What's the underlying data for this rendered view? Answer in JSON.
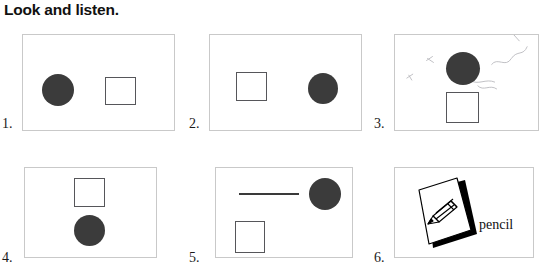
{
  "title": "Look and listen.",
  "colors": {
    "circle_fill": "#3b3b3b",
    "square_stroke": "#56565a",
    "panel_border": "#c9c9c9",
    "line_stroke": "#3a3a3a",
    "text": "#111111",
    "page_background": "#ffffff"
  },
  "exercises": [
    {
      "number": "1.",
      "shapes": [
        "circle",
        "square"
      ],
      "arrangement": "circle-left-square-right"
    },
    {
      "number": "2.",
      "shapes": [
        "square",
        "circle"
      ],
      "arrangement": "square-left-circle-right"
    },
    {
      "number": "3.",
      "shapes": [
        "circle",
        "square"
      ],
      "arrangement": "circle-top-square-below",
      "has_pencil_marks": true
    },
    {
      "number": "4.",
      "shapes": [
        "square",
        "circle"
      ],
      "arrangement": "square-top-circle-below"
    },
    {
      "number": "5.",
      "shapes": [
        "line",
        "circle",
        "square"
      ],
      "arrangement": "line-left-circle-topright-square-bottomleft"
    },
    {
      "number": "6.",
      "shapes": [
        "flashcard"
      ],
      "arrangement": "flashcard-with-label",
      "card_icon": "pencil-drawing",
      "word": "pencil"
    }
  ]
}
